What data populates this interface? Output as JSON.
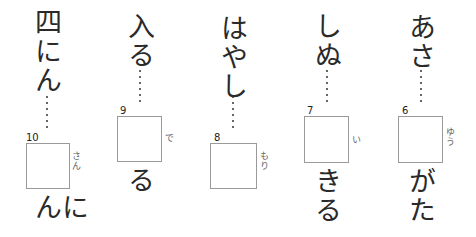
{
  "worksheet": {
    "questions": [
      {
        "number": "10",
        "before": "四にん",
        "reading": "さん",
        "after": "にん"
      },
      {
        "number": "9",
        "before": "入る",
        "reading": "で",
        "after": "る"
      },
      {
        "number": "8",
        "before": "はやし",
        "reading": "もり",
        "after": ""
      },
      {
        "number": "7",
        "before": "しぬ",
        "reading": "い",
        "after": "きる"
      },
      {
        "number": "6",
        "before": "あさ",
        "reading": "ゆう",
        "after": "がた"
      }
    ]
  }
}
